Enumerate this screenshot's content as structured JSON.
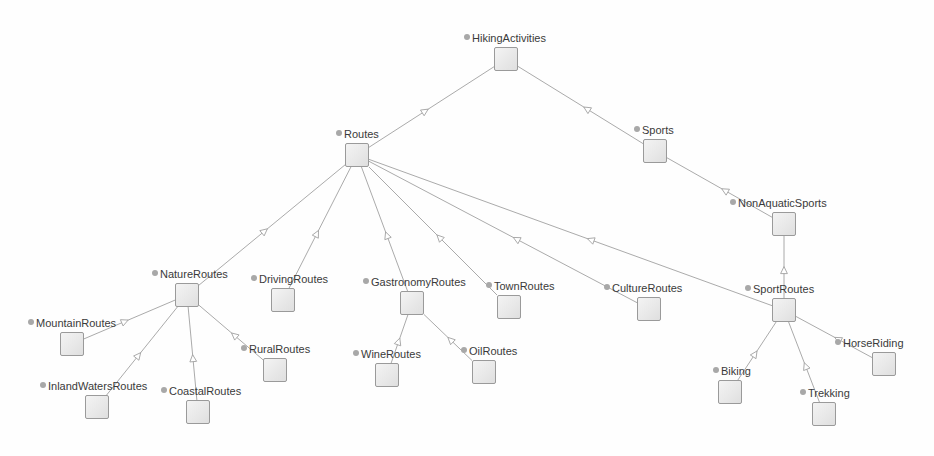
{
  "diagram": {
    "type": "class-hierarchy-tree",
    "background_color": "#fefefe",
    "node_fill_color": "#e6e6e6",
    "node_border_color": "#9a9a9a",
    "edge_color": "#a0a0a0",
    "label_color": "#3a3a3a",
    "bullet_color": "#a8a8a8",
    "node_box_size": 24,
    "canvas": {
      "width": 934,
      "height": 456
    }
  },
  "nodes": [
    {
      "id": "HikingActivities",
      "label": "HikingActivities",
      "box_x": 494,
      "box_y": 47,
      "label_x": 464,
      "label_y": 32
    },
    {
      "id": "Routes",
      "label": "Routes",
      "box_x": 345,
      "box_y": 143,
      "label_x": 336,
      "label_y": 128
    },
    {
      "id": "Sports",
      "label": "Sports",
      "box_x": 643,
      "box_y": 139,
      "label_x": 634,
      "label_y": 124
    },
    {
      "id": "NonAquaticSports",
      "label": "NonAquaticSports",
      "box_x": 772,
      "box_y": 212,
      "label_x": 730,
      "label_y": 197
    },
    {
      "id": "NatureRoutes",
      "label": "NatureRoutes",
      "box_x": 175,
      "box_y": 283,
      "label_x": 152,
      "label_y": 268
    },
    {
      "id": "DrivingRoutes",
      "label": "DrivingRoutes",
      "box_x": 271,
      "box_y": 288,
      "label_x": 251,
      "label_y": 273
    },
    {
      "id": "GastronomyRoutes",
      "label": "GastronomyRoutes",
      "box_x": 400,
      "box_y": 291,
      "label_x": 363,
      "label_y": 276
    },
    {
      "id": "TownRoutes",
      "label": "TownRoutes",
      "box_x": 497,
      "box_y": 295,
      "label_x": 486,
      "label_y": 280
    },
    {
      "id": "CultureRoutes",
      "label": "CultureRoutes",
      "box_x": 637,
      "box_y": 297,
      "label_x": 604,
      "label_y": 282
    },
    {
      "id": "SportRoutes",
      "label": "SportRoutes",
      "box_x": 772,
      "box_y": 298,
      "label_x": 745,
      "label_y": 283
    },
    {
      "id": "MountainRoutes",
      "label": "MountainRoutes",
      "box_x": 60,
      "box_y": 332,
      "label_x": 28,
      "label_y": 317
    },
    {
      "id": "RuralRoutes",
      "label": "RuralRoutes",
      "box_x": 263,
      "box_y": 358,
      "label_x": 241,
      "label_y": 343
    },
    {
      "id": "WineRoutes",
      "label": "WineRoutes",
      "box_x": 375,
      "box_y": 363,
      "label_x": 353,
      "label_y": 348
    },
    {
      "id": "OilRoutes",
      "label": "OilRoutes",
      "box_x": 472,
      "box_y": 360,
      "label_x": 461,
      "label_y": 345
    },
    {
      "id": "HorseRiding",
      "label": "HorseRiding",
      "box_x": 872,
      "box_y": 352,
      "label_x": 835,
      "label_y": 337
    },
    {
      "id": "InlandWatersRoutes",
      "label": "InlandWatersRoutes",
      "box_x": 85,
      "box_y": 395,
      "label_x": 40,
      "label_y": 380
    },
    {
      "id": "CoastalRoutes",
      "label": "CoastalRoutes",
      "box_x": 186,
      "box_y": 400,
      "label_x": 161,
      "label_y": 385
    },
    {
      "id": "Biking",
      "label": "Biking",
      "box_x": 718,
      "box_y": 380,
      "label_x": 713,
      "label_y": 365
    },
    {
      "id": "Trekking",
      "label": "Trekking",
      "box_x": 812,
      "box_y": 402,
      "label_x": 800,
      "label_y": 387
    }
  ],
  "edges": [
    {
      "child": "Routes",
      "parent": "HikingActivities"
    },
    {
      "child": "Sports",
      "parent": "HikingActivities"
    },
    {
      "child": "NonAquaticSports",
      "parent": "Sports"
    },
    {
      "child": "NatureRoutes",
      "parent": "Routes"
    },
    {
      "child": "DrivingRoutes",
      "parent": "Routes"
    },
    {
      "child": "GastronomyRoutes",
      "parent": "Routes"
    },
    {
      "child": "TownRoutes",
      "parent": "Routes"
    },
    {
      "child": "CultureRoutes",
      "parent": "Routes"
    },
    {
      "child": "SportRoutes",
      "parent": "Routes"
    },
    {
      "child": "SportRoutes",
      "parent": "NonAquaticSports"
    },
    {
      "child": "MountainRoutes",
      "parent": "NatureRoutes"
    },
    {
      "child": "InlandWatersRoutes",
      "parent": "NatureRoutes"
    },
    {
      "child": "CoastalRoutes",
      "parent": "NatureRoutes"
    },
    {
      "child": "RuralRoutes",
      "parent": "NatureRoutes"
    },
    {
      "child": "WineRoutes",
      "parent": "GastronomyRoutes"
    },
    {
      "child": "OilRoutes",
      "parent": "GastronomyRoutes"
    },
    {
      "child": "Biking",
      "parent": "SportRoutes"
    },
    {
      "child": "Trekking",
      "parent": "SportRoutes"
    },
    {
      "child": "HorseRiding",
      "parent": "SportRoutes"
    }
  ]
}
